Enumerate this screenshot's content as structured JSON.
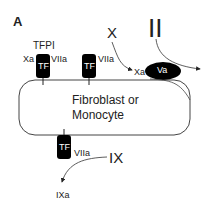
{
  "panel_label": "A",
  "cell": {
    "label_line1": "Fibroblast or",
    "label_line2": "Monocyte"
  },
  "tf_complexes": [
    {
      "receptor": "TF",
      "ligand": "VIIa",
      "inhibitor": "TFPI",
      "bound": "Xa"
    },
    {
      "receptor": "TF",
      "ligand": "VIIa"
    },
    {
      "receptor": "TF",
      "ligand": "VIIa"
    }
  ],
  "factors": {
    "x": "X",
    "xa": "Xa",
    "va": "Va",
    "ii": "II",
    "ix": "IX",
    "ixa": "IXa"
  },
  "colors": {
    "stroke": "#333333",
    "fill_dark": "#000000",
    "text": "#222222"
  }
}
